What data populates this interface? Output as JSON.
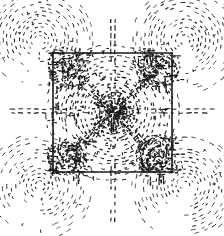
{
  "figure": {
    "title": "Contour / flux-line field map of a square region",
    "domain_type": "technical-illustration",
    "width": 224,
    "height": 236,
    "background_color": "#ffffff",
    "ink_color": "#1a1a1a",
    "caption": ""
  },
  "chart_data": {
    "type": "contour",
    "title": "Contour / flux-line field map of a square region",
    "xlabel": "",
    "ylabel": "",
    "xlim": [
      0,
      224
    ],
    "ylim": [
      0,
      236
    ],
    "grid": false,
    "legend_position": "none",
    "style": {
      "stroke": "#1a1a1a",
      "line_style": "dashed",
      "line_width_inner": 1.35,
      "line_width_outer": 1.0,
      "dash_short": "2 3",
      "dash_medium": "3 4",
      "dash_long": "4 5"
    },
    "boundary": {
      "name": "square-boundary",
      "shape": "square",
      "stroke": "#1a1a1a",
      "line_width": 1.6,
      "line_style": "solid",
      "x0": 53,
      "y0": 53,
      "x1": 172,
      "y1": 172,
      "center": [
        112.5,
        112.5
      ],
      "side_length": 119
    },
    "central_source": {
      "name": "central-singularity",
      "center": [
        113,
        113
      ],
      "contour_count": 16,
      "radii": [
        4,
        7,
        10,
        13.5,
        17,
        21,
        25,
        29,
        33.5,
        38,
        42.5,
        47,
        52,
        57,
        62,
        67
      ],
      "density": "very-high",
      "angular_jitter": 0.22
    },
    "corner_lobes": [
      {
        "name": "lobe-top-left",
        "center": [
          40,
          40
        ],
        "contour_count": 13,
        "radii": [
          5,
          9,
          13,
          17,
          21,
          25,
          29,
          33,
          37,
          41,
          45,
          49,
          53
        ],
        "arc_start_deg": 120,
        "arc_sweep_deg": 300,
        "density": "medium"
      },
      {
        "name": "lobe-top-right",
        "center": [
          185,
          40
        ],
        "contour_count": 13,
        "radii": [
          5,
          9,
          13,
          17,
          21,
          25,
          29,
          33,
          37,
          41,
          45,
          49,
          53
        ],
        "arc_start_deg": 120,
        "arc_sweep_deg": 300,
        "density": "medium"
      },
      {
        "name": "lobe-bottom-left",
        "center": [
          40,
          186
        ],
        "contour_count": 13,
        "radii": [
          5,
          9,
          13,
          17,
          21,
          25,
          29,
          33,
          37,
          41,
          45,
          49,
          53
        ],
        "arc_start_deg": 120,
        "arc_sweep_deg": 300,
        "density": "medium"
      },
      {
        "name": "lobe-bottom-right",
        "center": [
          185,
          186
        ],
        "contour_count": 13,
        "radii": [
          5,
          9,
          13,
          17,
          21,
          25,
          29,
          33,
          37,
          41,
          45,
          49,
          53
        ],
        "arc_start_deg": 120,
        "arc_sweep_deg": 300,
        "density": "medium"
      }
    ],
    "axes_lines": [
      {
        "name": "axis-left",
        "orientation": "horizontal",
        "x_from": 62,
        "x_to": 8,
        "y": 111,
        "pair_offset": 4
      },
      {
        "name": "axis-right",
        "orientation": "horizontal",
        "x_from": 163,
        "x_to": 217,
        "y": 111,
        "pair_offset": 4
      },
      {
        "name": "axis-top",
        "orientation": "vertical",
        "y_from": 62,
        "y_to": 12,
        "x": 113,
        "pair_offset": 4
      },
      {
        "name": "axis-bottom",
        "orientation": "vertical",
        "y_from": 163,
        "y_to": 222,
        "x": 113,
        "pair_offset": 4
      }
    ],
    "inner_axes_lines": [
      {
        "name": "inner-axis-horizontal",
        "orientation": "horizontal",
        "from": 55,
        "to": 170,
        "at": 111,
        "pair_offset": 4
      },
      {
        "name": "inner-axis-vertical",
        "orientation": "vertical",
        "from": 55,
        "to": 170,
        "at": 113,
        "pair_offset": 4
      }
    ],
    "diagonal_spokes": [
      {
        "name": "spoke-nw",
        "from": [
          60,
          60
        ],
        "to": [
          104,
          104
        ],
        "segments": 9
      },
      {
        "name": "spoke-ne",
        "from": [
          165,
          60
        ],
        "to": [
          122,
          104
        ],
        "segments": 9
      },
      {
        "name": "spoke-sw",
        "from": [
          60,
          165
        ],
        "to": [
          104,
          122
        ],
        "segments": 9
      },
      {
        "name": "spoke-se",
        "from": [
          165,
          165
        ],
        "to": [
          122,
          122
        ],
        "segments": 9
      }
    ],
    "corner_clusters": [
      {
        "name": "cluster-top-left",
        "center": [
          68,
          68
        ],
        "extent": 20,
        "density": "high"
      },
      {
        "name": "cluster-top-right",
        "center": [
          157,
          68
        ],
        "extent": 20,
        "density": "high"
      },
      {
        "name": "cluster-bottom-left",
        "center": [
          68,
          157
        ],
        "extent": 20,
        "density": "high"
      },
      {
        "name": "cluster-bottom-right",
        "center": [
          157,
          157
        ],
        "extent": 20,
        "density": "high"
      }
    ]
  }
}
